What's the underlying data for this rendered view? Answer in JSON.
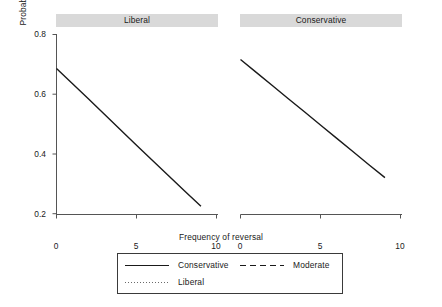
{
  "chart_data": {
    "type": "line",
    "title": "",
    "xlabel": "Frequency of reversal",
    "ylabel": "Probability that state wins",
    "xlim": [
      0,
      10
    ],
    "ylim": [
      0.2,
      0.8
    ],
    "xticks": [
      "0",
      "5",
      "10"
    ],
    "xtick_values": [
      0,
      5,
      10
    ],
    "yticks": [
      "0.8",
      "0.6",
      "0.4",
      "0.2"
    ],
    "ytick_values": [
      0.8,
      0.6,
      0.4,
      0.2
    ],
    "grid": false,
    "legend_position": "bottom",
    "panels": [
      {
        "label": "Liberal",
        "series": [
          {
            "name": "Conservative",
            "style": "solid",
            "x": [
              0,
              1,
              2,
              3,
              4,
              5,
              6,
              7,
              8,
              9
            ],
            "values": [
              0.685,
              0.634,
              0.583,
              0.531,
              0.479,
              0.427,
              0.376,
              0.325,
              0.274,
              0.224
            ]
          }
        ]
      },
      {
        "label": "Conservative",
        "series": [
          {
            "name": "Conservative",
            "style": "solid",
            "x": [
              0,
              1,
              2,
              3,
              4,
              5,
              6,
              7,
              8,
              9
            ],
            "values": [
              0.715,
              0.671,
              0.627,
              0.583,
              0.539,
              0.495,
              0.451,
              0.407,
              0.363,
              0.32
            ]
          }
        ]
      }
    ],
    "legend": [
      {
        "label": "Conservative",
        "style": "solid"
      },
      {
        "label": "Moderate",
        "style": "dashed"
      },
      {
        "label": "Liberal",
        "style": "dotted"
      }
    ],
    "colors": {
      "line": "#1a1a1a",
      "axis": "#555555",
      "panel_strip": "#d9d9d9",
      "legend_border": "#3a3a3a",
      "background": "#ffffff"
    }
  }
}
